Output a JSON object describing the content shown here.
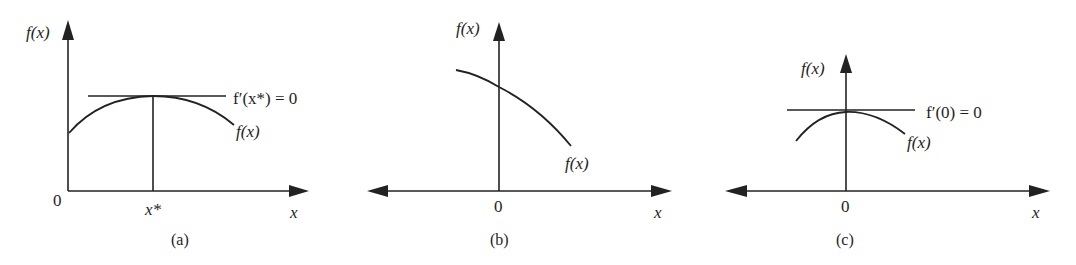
{
  "figure": {
    "panels": [
      {
        "id": "a",
        "caption": "(a)",
        "y_axis_label": "f(x)",
        "x_axis_label": "x",
        "origin_label": "0",
        "tick_label": "x*",
        "curve_label": "f(x)",
        "tangent_label": "f′(x*) = 0",
        "description": "Concave curve with a maximum at x*, horizontal tangent at the peak, vertical line from peak down to x*"
      },
      {
        "id": "b",
        "caption": "(b)",
        "y_axis_label": "f(x)",
        "x_axis_label": "x",
        "origin_label": "0",
        "curve_label": "f(x)",
        "description": "Decreasing concave curve crossing the y-axis, no stationary point"
      },
      {
        "id": "c",
        "caption": "(c)",
        "y_axis_label": "f(x)",
        "x_axis_label": "x",
        "origin_label": "0",
        "curve_label": "f(x)",
        "tangent_label": "f′(0) = 0",
        "description": "Concave curve with maximum at x = 0, horizontal tangent on the y-axis"
      }
    ],
    "colors": {
      "ink": "#222222",
      "background": "#ffffff"
    }
  }
}
